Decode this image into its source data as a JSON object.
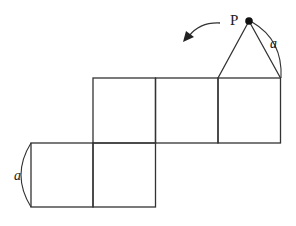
{
  "diagram": {
    "labels": {
      "point": "P",
      "edge_top": "a",
      "edge_left": "a"
    },
    "colors": {
      "stroke": "#333333",
      "background": "#ffffff"
    }
  }
}
